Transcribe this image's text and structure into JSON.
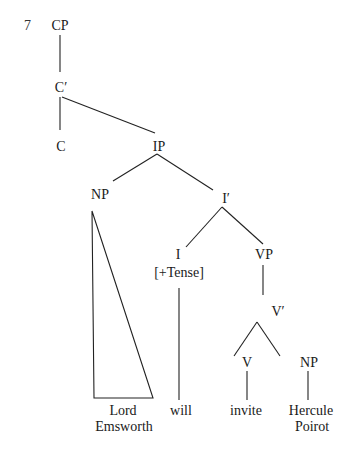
{
  "example_number": "7",
  "tree": {
    "nodes": {
      "cp": "CP",
      "c_bar": "C′",
      "c": "C",
      "ip": "IP",
      "np_subject": "NP",
      "i_bar": "I′",
      "i": "I",
      "i_feature": "[+Tense]",
      "vp": "VP",
      "v_bar": "V′",
      "v": "V",
      "np_object": "NP"
    },
    "leaves": {
      "subject_line1": "Lord",
      "subject_line2": "Emsworth",
      "aux": "will",
      "verb": "invite",
      "object_line1": "Hercule",
      "object_line2": "Poirot"
    }
  },
  "colors": {
    "line": "#222222",
    "text": "#1a1a1a"
  }
}
